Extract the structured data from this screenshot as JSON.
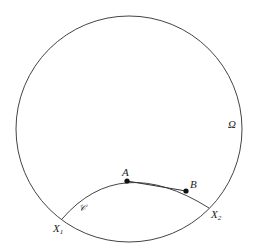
{
  "diagram": {
    "labels": {
      "omega": "Ω",
      "A": "A",
      "B": "B",
      "X1": "X",
      "X1_sub": "1",
      "X2": "X",
      "X2_sub": "2",
      "curve": "𝒞"
    },
    "colors": {
      "stroke": "#444444",
      "point": "#111111",
      "text": "#222222"
    }
  }
}
